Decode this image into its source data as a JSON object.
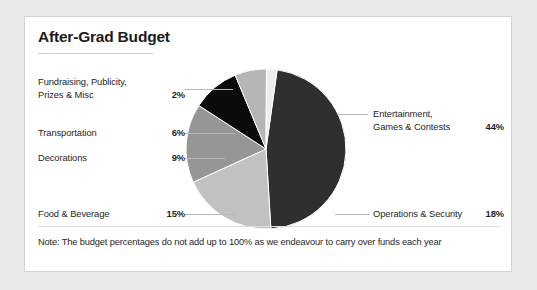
{
  "card": {
    "title": "After-Grad Budget",
    "note": "Note: The budget percentages do not add up to 100% as we endeavour to carry over funds each year"
  },
  "legend": {
    "left": [
      {
        "label_line1": "Fundraising, Publicity,",
        "label_line2": "Prizes & Misc",
        "value": "2%"
      },
      {
        "label_line1": "Transportation",
        "label_line2": "",
        "value": "6%"
      },
      {
        "label_line1": "Decorations",
        "label_line2": "",
        "value": "9%"
      },
      {
        "label_line1": "Food & Beverage",
        "label_line2": "",
        "value": "15%"
      }
    ],
    "right": [
      {
        "label_line1": "Entertainment,",
        "label_line2": "Games & Contests",
        "value": "44%"
      },
      {
        "label_line1": "Operations & Security",
        "label_line2": "",
        "value": "18%"
      }
    ]
  },
  "chart_data": {
    "type": "pie",
    "title": "After-Grad Budget",
    "xlabel": "",
    "ylabel": "",
    "legend_position": "outside-leader-lines",
    "grid": false,
    "note": "Note: The budget percentages do not add up to 100% as we endeavour to carry over funds each year",
    "categories": [
      "Entertainment, Games & Contests",
      "Operations & Security",
      "Food & Beverage",
      "Decorations",
      "Transportation",
      "Fundraising, Publicity, Prizes & Misc"
    ],
    "values": [
      44,
      18,
      15,
      9,
      6,
      2
    ],
    "labels": [
      "44%",
      "18%",
      "15%",
      "9%",
      "6%",
      "2%"
    ],
    "colors": [
      "#2f2f2f",
      "#c2c2c2",
      "#969696",
      "#0b0b0b",
      "#b5b5b5",
      "#ededed"
    ],
    "total": 94,
    "start_angle_deg": 0,
    "direction": "clockwise"
  },
  "colors": {
    "page_background": "#e9e9e9",
    "card_background": "#ffffff",
    "card_border": "#d2d2d2",
    "text": "#1f1f1f",
    "rule": "#cfcfcf",
    "leader_line": "#b9b9b9"
  }
}
